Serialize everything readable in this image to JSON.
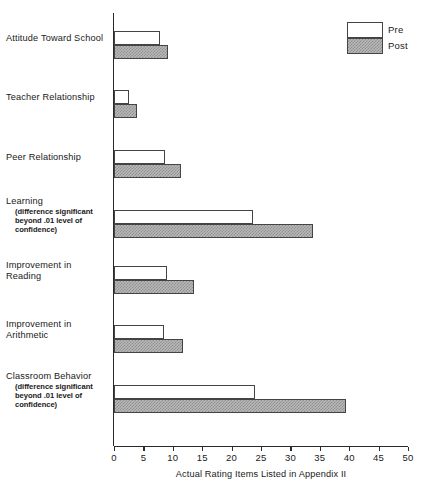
{
  "chart_data": {
    "type": "bar",
    "orientation": "horizontal",
    "title": "",
    "xlabel": "Actual Rating Items Listed in Appendix II",
    "ylabel": "",
    "xlim": [
      0,
      50
    ],
    "xticks": [
      0,
      5,
      10,
      15,
      20,
      25,
      30,
      35,
      40,
      45,
      50
    ],
    "grid": false,
    "legend_position": "top-right",
    "categories": [
      "Attitude Toward School",
      "Teacher Relationship",
      "Peer Relationship",
      "Learning",
      "Improvement in Reading",
      "Improvement in Arithmetic",
      "Classroom Behavior"
    ],
    "series": [
      {
        "name": "Pre",
        "values": [
          7.8,
          2.5,
          8.7,
          23.6,
          9.0,
          8.5,
          24.0
        ]
      },
      {
        "name": "Post",
        "values": [
          9.2,
          3.9,
          11.4,
          33.8,
          13.6,
          11.7,
          39.5
        ]
      }
    ],
    "annotations": [
      "(difference significant beyond .01 level of confidence)"
    ]
  },
  "legend": {
    "items": [
      {
        "label": "Pre",
        "swatch": "white-open-rect"
      },
      {
        "label": "Post",
        "swatch": "hatched-gray-rect"
      }
    ]
  },
  "axis": {
    "x_title": "Actual Rating Items Listed in Appendix II",
    "x_tick_labels": [
      "0",
      "5",
      "10",
      "15",
      "20",
      "25",
      "30",
      "35",
      "40",
      "45",
      "50"
    ]
  },
  "categories": [
    {
      "name": "attitude-toward-school",
      "label": "Attitude Toward School",
      "note_lines": [],
      "pre": 7.8,
      "post": 9.2
    },
    {
      "name": "teacher-relationship",
      "label": "Teacher Relationship",
      "note_lines": [],
      "pre": 2.5,
      "post": 3.9
    },
    {
      "name": "peer-relationship",
      "label": "Peer Relationship",
      "note_lines": [],
      "pre": 8.7,
      "post": 11.4
    },
    {
      "name": "learning",
      "label": "Learning",
      "note_lines": [
        "(difference significant",
        "beyond .01 level of",
        "confidence)"
      ],
      "pre": 23.6,
      "post": 33.8
    },
    {
      "name": "improvement-in-reading",
      "label": "Improvement in",
      "label_line2": "Reading",
      "note_lines": [],
      "pre": 9.0,
      "post": 13.6
    },
    {
      "name": "improvement-in-arithmetic",
      "label": "Improvement in",
      "label_line2": "Arithmetic",
      "note_lines": [],
      "pre": 8.5,
      "post": 11.7
    },
    {
      "name": "classroom-behavior",
      "label": "Classroom Behavior",
      "note_lines": [
        "(difference significant",
        "beyond .01 level of",
        "confidence)"
      ],
      "pre": 24.0,
      "post": 39.5
    }
  ],
  "colors": {
    "axis": "#2a2a2a",
    "bar_outline": "#444444",
    "pre_fill": "#ffffff",
    "post_fill": "#b9b9b9",
    "text": "#1a1a1a"
  }
}
